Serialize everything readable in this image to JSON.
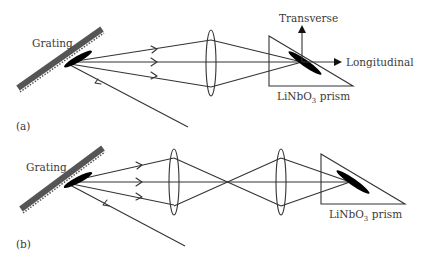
{
  "figure": {
    "panel_a": {
      "tag": "(a)",
      "grating_label": "Grating",
      "prism_label_main": "LiNbO",
      "prism_label_sub": "3",
      "prism_label_rest": " prism",
      "axis_transverse": "Transverse",
      "axis_longitudinal": "Longitudinal"
    },
    "panel_b": {
      "tag": "(b)",
      "grating_label": "Grating",
      "prism_label_main": "LiNbO",
      "prism_label_sub": "3",
      "prism_label_rest": " prism"
    }
  },
  "colors": {
    "line": "#333333",
    "grating": "#555555",
    "pulse": "#000000",
    "text": "#3a3a3a",
    "background": "#ffffff"
  }
}
